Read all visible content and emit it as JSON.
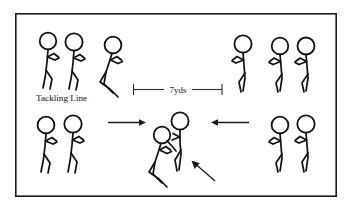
{
  "diagram": {
    "background_color": "#ffffff",
    "frame": {
      "name": "diagram-border",
      "x": 15,
      "y": 13,
      "width": 322,
      "height": 184,
      "stroke_color": "#1a1a1a"
    },
    "labels": {
      "tackling_line": "Tackling Line",
      "distance": "7yds"
    },
    "dimension": {
      "name": "distance-dimension",
      "value": "7yds",
      "x_start": 133,
      "x_end": 222,
      "y": 89,
      "cap_height": 11,
      "color": "#2b2b2b"
    },
    "tackling_line_label": {
      "x": 36,
      "y": 100,
      "color": "#111111"
    },
    "figure_color": "#111111",
    "figures": [
      {
        "id": "left-line-player-1",
        "role": "tackler-waiting",
        "x": 48,
        "y": 33,
        "facing": "right",
        "pose": "standing-ready"
      },
      {
        "id": "left-line-player-2",
        "role": "tackler-waiting",
        "x": 74,
        "y": 34,
        "facing": "right",
        "pose": "standing-ready"
      },
      {
        "id": "left-lunging-player",
        "role": "tackler-active",
        "x": 108,
        "y": 37,
        "facing": "right",
        "pose": "crouched-lunge"
      },
      {
        "id": "right-line-player-1",
        "role": "ball-carrier-waiting",
        "x": 240,
        "y": 36,
        "facing": "left",
        "pose": "standing-ready"
      },
      {
        "id": "right-line-player-2",
        "role": "ball-carrier-waiting",
        "x": 277,
        "y": 38,
        "facing": "left",
        "pose": "standing-ready"
      },
      {
        "id": "right-line-player-3",
        "role": "ball-carrier-waiting",
        "x": 303,
        "y": 38,
        "facing": "left",
        "pose": "standing-ready"
      },
      {
        "id": "bottom-left-player-1",
        "role": "tackler-queue",
        "x": 46,
        "y": 117,
        "facing": "right",
        "pose": "standing-ready"
      },
      {
        "id": "bottom-left-player-2",
        "role": "tackler-queue",
        "x": 72,
        "y": 116,
        "facing": "right",
        "pose": "standing-ready"
      },
      {
        "id": "contact-tackler",
        "role": "tackler-contact",
        "x": 158,
        "y": 128,
        "facing": "right",
        "pose": "crouched-tackle"
      },
      {
        "id": "contact-ball-carrier",
        "role": "ball-carrier-contact",
        "x": 178,
        "y": 113,
        "facing": "left",
        "pose": "standing-impact"
      },
      {
        "id": "bottom-right-player-1",
        "role": "ball-carrier-queue",
        "x": 277,
        "y": 117,
        "facing": "left",
        "pose": "standing-ready"
      },
      {
        "id": "bottom-right-player-2",
        "role": "ball-carrier-queue",
        "x": 303,
        "y": 116,
        "facing": "left",
        "pose": "standing-ready"
      }
    ],
    "arrows": [
      {
        "id": "arrow-tackler-approach",
        "direction": "right",
        "x_start": 108,
        "x_end": 145,
        "y": 122,
        "color": "#1a1a1a"
      },
      {
        "id": "arrow-carrier-approach",
        "direction": "left",
        "x_start": 248,
        "x_end": 211,
        "y": 122,
        "color": "#1a1a1a"
      },
      {
        "id": "arrow-contact-point",
        "direction": "up-left",
        "x_start": 214,
        "y_start": 180,
        "x_end": 192,
        "y_end": 161,
        "color": "#1a1a1a"
      }
    ]
  }
}
